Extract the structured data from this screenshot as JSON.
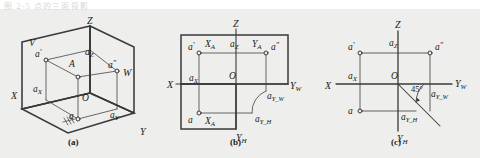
{
  "figure": {
    "top_partial_text": "图 2-5  点的三面投影",
    "background_color": "#eeeeec",
    "ink_color": "#3a3a3a",
    "captions": [
      {
        "key": "a",
        "label": "(a)",
        "x": 74,
        "y": 139
      },
      {
        "key": "b",
        "label": "(b)",
        "x": 236,
        "y": 139
      },
      {
        "key": "c",
        "label": "(c)",
        "x": 396,
        "y": 139
      }
    ]
  },
  "panel_a": {
    "name": "pictorial-three-plane-projection",
    "labels": [
      {
        "id": "plane-V",
        "text": "V",
        "x": 29,
        "y": 32,
        "style": "italic"
      },
      {
        "id": "plane-W",
        "text": "W",
        "x": 123,
        "y": 62,
        "style": "italic"
      },
      {
        "id": "axis-Z",
        "text": "Z",
        "x": 89,
        "y": 22,
        "style": "italic"
      },
      {
        "id": "axis-X",
        "text": "X",
        "x": 14,
        "y": 85,
        "style": "italic"
      },
      {
        "id": "axis-Y",
        "text": "Y",
        "x": 143,
        "y": 123,
        "style": "italic"
      },
      {
        "id": "origin-O",
        "text": "O",
        "x": 83,
        "y": 89,
        "style": "italic"
      },
      {
        "id": "point-A",
        "text": "A",
        "x": 70,
        "y": 55,
        "style": "italic"
      },
      {
        "id": "point-a-v",
        "text": "a",
        "sup": "′",
        "x": 37,
        "y": 46,
        "style": "italic"
      },
      {
        "id": "point-a-w",
        "text": "a",
        "sup": "″",
        "x": 111,
        "y": 57,
        "style": "italic"
      },
      {
        "id": "point-a-h",
        "text": "a",
        "x": 68,
        "y": 107,
        "style": "italic"
      },
      {
        "id": "point-aZ",
        "text": "a",
        "sub": "Z",
        "x": 89,
        "y": 44,
        "style": "italic"
      },
      {
        "id": "point-aX",
        "text": "a",
        "sub": "X",
        "x": 36,
        "y": 80,
        "style": "italic"
      },
      {
        "id": "point-aY",
        "text": "a",
        "sub": "Y",
        "x": 113,
        "y": 106,
        "style": "italic"
      }
    ]
  },
  "panel_b": {
    "name": "unfolding-projection-planes",
    "labels": [
      {
        "id": "axis-Z",
        "text": "Z",
        "x": 240,
        "y": 18,
        "style": "italic"
      },
      {
        "id": "axis-X",
        "text": "X",
        "x": 168,
        "y": 79,
        "style": "italic"
      },
      {
        "id": "axis-YW",
        "text": "Y",
        "sub": "W",
        "x": 290,
        "y": 80,
        "style": "italic"
      },
      {
        "id": "axis-YH",
        "text": "Y",
        "sub": "H",
        "x": 239,
        "y": 127,
        "style": "italic"
      },
      {
        "id": "origin-O",
        "text": "O",
        "x": 232,
        "y": 69,
        "style": "italic"
      },
      {
        "id": "point-a-v",
        "text": "a",
        "sup": "′",
        "x": 190,
        "y": 35,
        "style": "italic"
      },
      {
        "id": "point-a-w",
        "text": "a",
        "sup": "″",
        "x": 272,
        "y": 35,
        "style": "italic"
      },
      {
        "id": "point-a-h",
        "text": "a",
        "x": 190,
        "y": 112,
        "style": "italic"
      },
      {
        "id": "coord-XA-top",
        "text": "X",
        "sub": "A",
        "x": 207,
        "y": 33,
        "style": "italic"
      },
      {
        "id": "coord-XA-bottom",
        "text": "X",
        "sub": "A",
        "x": 207,
        "y": 113,
        "style": "italic"
      },
      {
        "id": "coord-aZ",
        "text": "a",
        "sub": "Z",
        "x": 232,
        "y": 33,
        "style": "italic"
      },
      {
        "id": "coord-YA",
        "text": "Y",
        "sub": "A",
        "x": 254,
        "y": 33,
        "style": "italic"
      },
      {
        "id": "coord-aX",
        "text": "a",
        "sub": "X",
        "x": 191,
        "y": 71,
        "style": "italic"
      },
      {
        "id": "coord-aYW",
        "text": "a",
        "sub": "Y_W",
        "x": 268,
        "y": 87,
        "style": "italic"
      },
      {
        "id": "coord-aYH",
        "text": "a",
        "sub": "Y_H",
        "x": 258,
        "y": 110,
        "style": "italic"
      }
    ]
  },
  "panel_c": {
    "name": "final-three-view-layout",
    "angle_label": "45°",
    "labels": [
      {
        "id": "axis-Z",
        "text": "Z",
        "x": 402,
        "y": 19,
        "style": "italic"
      },
      {
        "id": "axis-X",
        "text": "X",
        "x": 326,
        "y": 78,
        "style": "italic"
      },
      {
        "id": "axis-YW",
        "text": "Y",
        "sub": "W",
        "x": 456,
        "y": 77,
        "style": "italic"
      },
      {
        "id": "axis-YH",
        "text": "Y",
        "sub": "H",
        "x": 400,
        "y": 128,
        "style": "italic"
      },
      {
        "id": "origin-O",
        "text": "O",
        "x": 394,
        "y": 68,
        "style": "italic"
      },
      {
        "id": "point-a-v",
        "text": "a",
        "sup": "′",
        "x": 350,
        "y": 34,
        "style": "italic"
      },
      {
        "id": "point-a-w",
        "text": "a",
        "sup": "″",
        "x": 437,
        "y": 34,
        "style": "italic"
      },
      {
        "id": "point-a-h",
        "text": "a",
        "x": 351,
        "y": 107,
        "style": "italic"
      },
      {
        "id": "coord-aZ",
        "text": "a",
        "sub": "Z",
        "x": 392,
        "y": 32,
        "style": "italic"
      },
      {
        "id": "coord-aX",
        "text": "a",
        "sub": "X",
        "x": 350,
        "y": 67,
        "style": "italic"
      },
      {
        "id": "coord-aYW",
        "text": "a",
        "sub": "Y_W",
        "x": 432,
        "y": 85,
        "style": "italic"
      },
      {
        "id": "coord-aYH",
        "text": "a",
        "sub": "Y_H",
        "x": 404,
        "y": 108,
        "style": "italic"
      }
    ]
  }
}
